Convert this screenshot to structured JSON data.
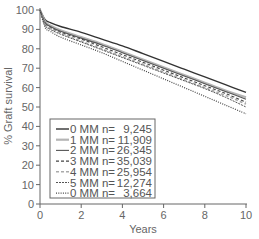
{
  "chart_data": {
    "type": "line",
    "title": "",
    "xlabel": "Years",
    "ylabel": "% Graft survival",
    "xlim": [
      0,
      10
    ],
    "ylim": [
      0,
      100
    ],
    "xticks": [
      0,
      2,
      4,
      6,
      8,
      10
    ],
    "yticks": [
      0,
      10,
      20,
      30,
      40,
      50,
      60,
      70,
      80,
      90,
      100
    ],
    "grid": false,
    "legend_position": "lower-left (inside)",
    "x": [
      0,
      0.25,
      0.5,
      1,
      2,
      3,
      4,
      5,
      6,
      7,
      8,
      9,
      10
    ],
    "series": [
      {
        "name": "0 MM n= 9,245",
        "label": "0 MM",
        "n": "9,245",
        "style": "solid",
        "color": "#333333",
        "width": 1.4,
        "values": [
          100,
          95,
          93.5,
          91.5,
          88.5,
          85,
          81.5,
          77.5,
          73.5,
          69.5,
          65.5,
          61.5,
          57.5
        ]
      },
      {
        "name": "1 MM n=11,909",
        "label": "1 MM",
        "n": "11,909",
        "style": "solid",
        "color": "#b5b5b5",
        "width": 2.2,
        "values": [
          100,
          94,
          92,
          89.5,
          86,
          82.5,
          78.5,
          74.5,
          70.5,
          66.5,
          62.5,
          58.5,
          55
        ]
      },
      {
        "name": "2 MM n=26,345",
        "label": "2 MM",
        "n": "26,345",
        "style": "solid",
        "color": "#555555",
        "width": 1.1,
        "values": [
          100,
          93.5,
          91.5,
          89,
          85.5,
          82,
          78,
          74,
          70,
          66,
          62,
          58,
          54
        ]
      },
      {
        "name": "3 MM n=35,039",
        "label": "3 MM",
        "n": "35,039",
        "style": "dashed",
        "color": "#444444",
        "width": 1.1,
        "values": [
          100,
          93,
          91,
          88.5,
          85,
          81,
          77,
          73,
          69,
          65,
          61,
          57,
          52.5
        ]
      },
      {
        "name": "4 MM n=25,954",
        "label": "4 MM",
        "n": "25,954",
        "style": "dashed",
        "color": "#aaaaaa",
        "width": 1.6,
        "values": [
          100,
          92.5,
          90.5,
          88,
          84,
          80,
          76,
          72,
          68,
          64,
          60,
          56,
          51.5
        ]
      },
      {
        "name": "5 MM n=12,274",
        "label": "5 MM",
        "n": "12,274",
        "style": "dashdot",
        "color": "#555555",
        "width": 1.0,
        "values": [
          100,
          92,
          90,
          87.5,
          83.5,
          79.5,
          75.5,
          71.5,
          67.5,
          63.5,
          59.5,
          55,
          50
        ]
      },
      {
        "name": "0 MM n= 3,664",
        "label": "0 MM",
        "n": "3,664",
        "style": "dotted",
        "color": "#444444",
        "width": 1.2,
        "values": [
          100,
          91,
          89,
          86,
          82,
          78,
          73.5,
          69,
          64.5,
          60,
          55.5,
          51,
          46.5
        ]
      }
    ]
  }
}
